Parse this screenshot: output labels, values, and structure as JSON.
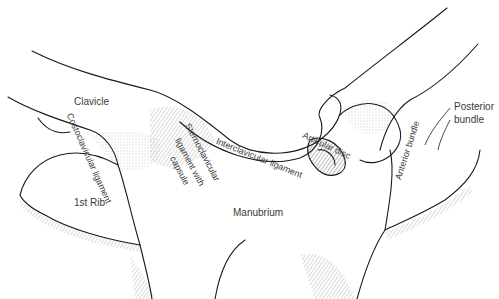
{
  "diagram": {
    "labels": {
      "clavicle": "Clavicle",
      "costoclavicular_ligament": "Costoclavicular ligament",
      "first_rib": "1st Rib",
      "sternoclavicular_1": "Sternoclavicular",
      "sternoclavicular_2": "ligament with",
      "sternoclavicular_3": "capsule",
      "interclavicular_ligament": "Interclavicular ligament",
      "articular_disc": "Articular disc",
      "anterior_bundle": "Anterior bundle",
      "posterior_bundle_1": "Posterior",
      "posterior_bundle_2": "bundle",
      "manubrium": "Manubrium"
    },
    "colors": {
      "ink": "#1a1a1a",
      "label": "#3a3a3a",
      "background": "#ffffff"
    }
  }
}
